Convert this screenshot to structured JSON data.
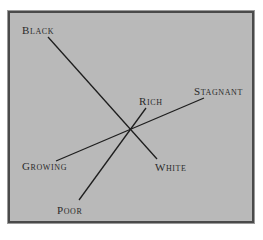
{
  "diagram": {
    "background_color": "#b9b9b9",
    "border_color": "#4a4a4a",
    "line_color": "#1e1e1e",
    "center": {
      "x": 132,
      "y": 127
    },
    "axes": [
      {
        "name": "black-white",
        "start_label": "Black",
        "end_label": "White",
        "start": {
          "x": 48,
          "y": 37
        },
        "end": {
          "x": 157,
          "y": 159
        }
      },
      {
        "name": "growing-stagnant",
        "start_label": "Growing",
        "end_label": "Stagnant",
        "start": {
          "x": 56,
          "y": 161
        },
        "end": {
          "x": 204,
          "y": 98
        }
      },
      {
        "name": "poor-rich",
        "start_label": "Poor",
        "end_label": "Rich",
        "start": {
          "x": 79,
          "y": 200
        },
        "end": {
          "x": 146,
          "y": 108
        }
      }
    ],
    "labels": {
      "black": "Black",
      "white": "White",
      "growing": "Growing",
      "stagnant": "Stagnant",
      "poor": "Poor",
      "rich": "Rich"
    }
  }
}
